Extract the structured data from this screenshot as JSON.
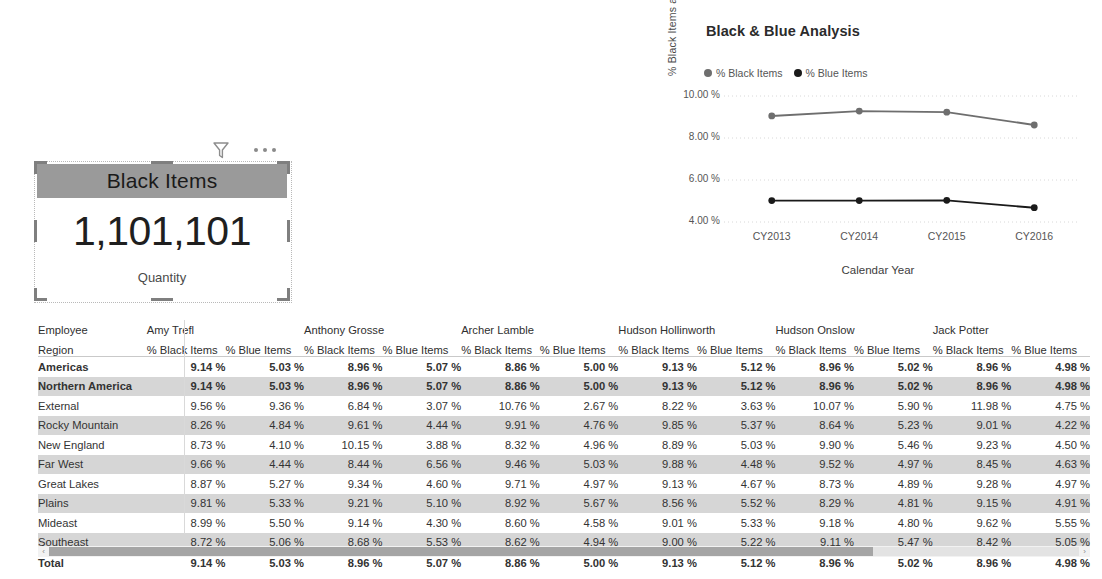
{
  "card": {
    "title": "Black Items",
    "value": "1,101,101",
    "sublabel": "Quantity",
    "filter_icon": "filter-icon",
    "more_icon": "more-options-icon"
  },
  "chart": {
    "title": "Black & Blue Analysis",
    "legend": [
      {
        "label": "% Black Items",
        "color": "#6e6e6e"
      },
      {
        "label": "% Blue Items",
        "color": "#1a1a1a"
      }
    ]
  },
  "chart_data": {
    "type": "line",
    "title": "Black & Blue Analysis",
    "xlabel": "Calendar Year",
    "ylabel": "% Black Items and % Blue I...",
    "x": [
      "CY2013",
      "CY2014",
      "CY2015",
      "CY2016"
    ],
    "ylim": [
      4.0,
      10.0
    ],
    "yticks": [
      "4.00 %",
      "6.00 %",
      "8.00 %",
      "10.00 %"
    ],
    "ytick_values": [
      4.0,
      6.0,
      8.0,
      10.0
    ],
    "grid": true,
    "legend_position": "top-left",
    "series": [
      {
        "name": "% Black Items",
        "color": "#6e6e6e",
        "values": [
          9.05,
          9.28,
          9.23,
          8.62
        ]
      },
      {
        "name": "% Blue Items",
        "color": "#1a1a1a",
        "values": [
          5.02,
          5.02,
          5.03,
          4.68
        ]
      }
    ]
  },
  "matrix": {
    "row_headers": [
      "Employee",
      "Region"
    ],
    "employees": [
      "Amy Trefl",
      "Anthony Grosse",
      "Archer Lamble",
      "Hudson Hollinworth",
      "Hudson Onslow",
      "Jack Potter"
    ],
    "measures": [
      "% Black Items",
      "% Blue Items"
    ],
    "rows": [
      {
        "region": "Americas",
        "level": 0,
        "bold": true,
        "banded": false,
        "values": [
          "9.14 %",
          "5.03 %",
          "8.96 %",
          "5.07 %",
          "8.86 %",
          "5.00 %",
          "9.13 %",
          "5.12 %",
          "8.96 %",
          "5.02 %",
          "8.96 %",
          "4.98 %"
        ]
      },
      {
        "region": "Northern America",
        "level": 1,
        "bold": true,
        "banded": true,
        "values": [
          "9.14 %",
          "5.03 %",
          "8.96 %",
          "5.07 %",
          "8.86 %",
          "5.00 %",
          "9.13 %",
          "5.12 %",
          "8.96 %",
          "5.02 %",
          "8.96 %",
          "4.98 %"
        ]
      },
      {
        "region": "External",
        "level": 2,
        "bold": false,
        "banded": false,
        "values": [
          "9.56 %",
          "9.36 %",
          "6.84 %",
          "3.07 %",
          "10.76 %",
          "2.67 %",
          "8.22 %",
          "3.63 %",
          "10.07 %",
          "5.90 %",
          "11.98 %",
          "4.75 %"
        ]
      },
      {
        "region": "Rocky Mountain",
        "level": 2,
        "bold": false,
        "banded": true,
        "values": [
          "8.26 %",
          "4.84 %",
          "9.61 %",
          "4.44 %",
          "9.91 %",
          "4.76 %",
          "9.85 %",
          "5.37 %",
          "8.64 %",
          "5.23 %",
          "9.01 %",
          "4.22 %"
        ]
      },
      {
        "region": "New England",
        "level": 2,
        "bold": false,
        "banded": false,
        "values": [
          "8.73 %",
          "4.10 %",
          "10.15 %",
          "3.88 %",
          "8.32 %",
          "4.96 %",
          "8.89 %",
          "5.03 %",
          "9.90 %",
          "5.46 %",
          "9.23 %",
          "4.50 %"
        ]
      },
      {
        "region": "Far West",
        "level": 2,
        "bold": false,
        "banded": true,
        "values": [
          "9.66 %",
          "4.44 %",
          "8.44 %",
          "6.56 %",
          "9.46 %",
          "5.03 %",
          "9.88 %",
          "4.48 %",
          "9.52 %",
          "4.97 %",
          "8.45 %",
          "4.63 %"
        ]
      },
      {
        "region": "Great Lakes",
        "level": 2,
        "bold": false,
        "banded": false,
        "values": [
          "8.87 %",
          "5.27 %",
          "9.34 %",
          "4.60 %",
          "9.71 %",
          "4.97 %",
          "9.13 %",
          "4.67 %",
          "8.73 %",
          "4.89 %",
          "9.28 %",
          "4.97 %"
        ]
      },
      {
        "region": "Plains",
        "level": 2,
        "bold": false,
        "banded": true,
        "values": [
          "9.81 %",
          "5.33 %",
          "9.21 %",
          "5.10 %",
          "8.92 %",
          "5.67 %",
          "8.56 %",
          "5.52 %",
          "8.29 %",
          "4.81 %",
          "9.15 %",
          "4.91 %"
        ]
      },
      {
        "region": "Mideast",
        "level": 2,
        "bold": false,
        "banded": false,
        "values": [
          "8.99 %",
          "5.50 %",
          "9.14 %",
          "4.30 %",
          "8.60 %",
          "4.58 %",
          "9.01 %",
          "5.33 %",
          "9.18 %",
          "4.80 %",
          "9.62 %",
          "5.55 %"
        ]
      },
      {
        "region": "Southeast",
        "level": 2,
        "bold": false,
        "banded": true,
        "values": [
          "8.72 %",
          "5.06 %",
          "8.68 %",
          "5.53 %",
          "8.62 %",
          "4.94 %",
          "9.00 %",
          "5.22 %",
          "9.11 %",
          "5.47 %",
          "8.42 %",
          "5.05 %"
        ]
      },
      {
        "region": "Total",
        "level": 0,
        "bold": true,
        "banded": false,
        "total": true,
        "values": [
          "9.14 %",
          "5.03 %",
          "8.96 %",
          "5.07 %",
          "8.86 %",
          "5.00 %",
          "9.13 %",
          "5.12 %",
          "8.96 %",
          "5.02 %",
          "8.96 %",
          "4.98 %"
        ]
      }
    ]
  },
  "scrollbar": {
    "left_arrow": "‹",
    "right_arrow": "›",
    "thumb_percent": 80
  }
}
